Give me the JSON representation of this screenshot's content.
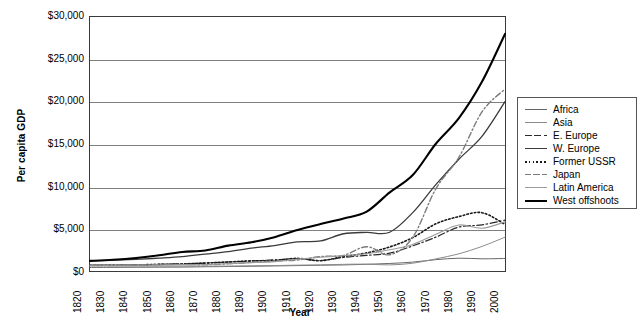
{
  "chart_data": {
    "type": "line",
    "title": "",
    "xlabel": "Year",
    "ylabel": "Per capita GDP",
    "xlim": [
      1820,
      2000
    ],
    "ylim": [
      0,
      30000
    ],
    "grid": true,
    "legend_position": "right",
    "x": [
      1820,
      1830,
      1840,
      1850,
      1860,
      1870,
      1880,
      1890,
      1900,
      1910,
      1920,
      1930,
      1940,
      1950,
      1960,
      1970,
      1980,
      1990,
      2000
    ],
    "xticklabels": [
      "1820",
      "1830",
      "1840",
      "1850",
      "1860",
      "1870",
      "1880",
      "1890",
      "1900",
      "1910",
      "1920",
      "1930",
      "1940",
      "1950",
      "1960",
      "1970",
      "1980",
      "1990",
      "2000"
    ],
    "yticks": [
      0,
      5000,
      10000,
      15000,
      20000,
      25000,
      30000
    ],
    "yticklabels": [
      "$0",
      "$5,000",
      "$10,000",
      "$15,000",
      "$20,000",
      "$25,000",
      "$30,000"
    ],
    "series": [
      {
        "name": "Africa",
        "style": "solid",
        "color": "#666666",
        "width": 1,
        "values": [
          420,
          430,
          440,
          450,
          460,
          500,
          530,
          560,
          600,
          640,
          680,
          720,
          790,
          890,
          1050,
          1340,
          1510,
          1440,
          1480
        ]
      },
      {
        "name": "Asia",
        "style": "solid",
        "color": "#8a8a8a",
        "width": 1,
        "values": [
          580,
          580,
          580,
          570,
          570,
          560,
          580,
          610,
          640,
          690,
          720,
          790,
          810,
          720,
          920,
          1430,
          2030,
          2900,
          4000
        ]
      },
      {
        "name": "E. Europe",
        "style": "dashdot",
        "color": "#2a2a2a",
        "width": 1.2,
        "values": [
          680,
          700,
          740,
          790,
          850,
          940,
          1060,
          1180,
          1320,
          1450,
          1240,
          1600,
          1850,
          2110,
          2970,
          4000,
          5190,
          5450,
          6000
        ]
      },
      {
        "name": "W. Europe",
        "style": "solid",
        "color": "#3a3a3a",
        "width": 1.3,
        "values": [
          1200,
          1280,
          1380,
          1520,
          1700,
          2000,
          2300,
          2700,
          3000,
          3450,
          3550,
          4400,
          4560,
          4580,
          6900,
          10200,
          13200,
          15900,
          20000
        ]
      },
      {
        "name": "Former USSR",
        "style": "dotted",
        "color": "#1a1a1a",
        "width": 1.6,
        "values": [
          690,
          700,
          730,
          780,
          840,
          940,
          1070,
          1200,
          1240,
          1490,
          1220,
          1720,
          2140,
          2840,
          3940,
          5570,
          6430,
          6890,
          5500
        ]
      },
      {
        "name": "Japan",
        "style": "dashdot2",
        "color": "#7a7a7a",
        "width": 1.4,
        "values": [
          670,
          690,
          710,
          740,
          780,
          740,
          850,
          1010,
          1180,
          1300,
          1700,
          1850,
          2870,
          1920,
          3990,
          9710,
          13430,
          18790,
          21500
        ]
      },
      {
        "name": "Latin America",
        "style": "solid",
        "color": "#9a9a9a",
        "width": 1.1,
        "values": [
          690,
          690,
          700,
          700,
          720,
          760,
          880,
          990,
          1110,
          1400,
          1630,
          1810,
          2030,
          2500,
          3140,
          4340,
          5440,
          5050,
          5800
        ]
      },
      {
        "name": "West offshoots",
        "style": "solid",
        "color": "#000000",
        "width": 2.1,
        "values": [
          1200,
          1330,
          1540,
          1850,
          2250,
          2420,
          3000,
          3400,
          4000,
          4850,
          5550,
          6200,
          7010,
          9290,
          11330,
          15030,
          18060,
          22350,
          28000
        ]
      }
    ]
  },
  "legend": {
    "items": [
      {
        "label": "Africa"
      },
      {
        "label": "Asia"
      },
      {
        "label": "E. Europe"
      },
      {
        "label": "W. Europe"
      },
      {
        "label": "Former USSR"
      },
      {
        "label": "Japan"
      },
      {
        "label": "Latin America"
      },
      {
        "label": "West offshoots"
      }
    ]
  }
}
